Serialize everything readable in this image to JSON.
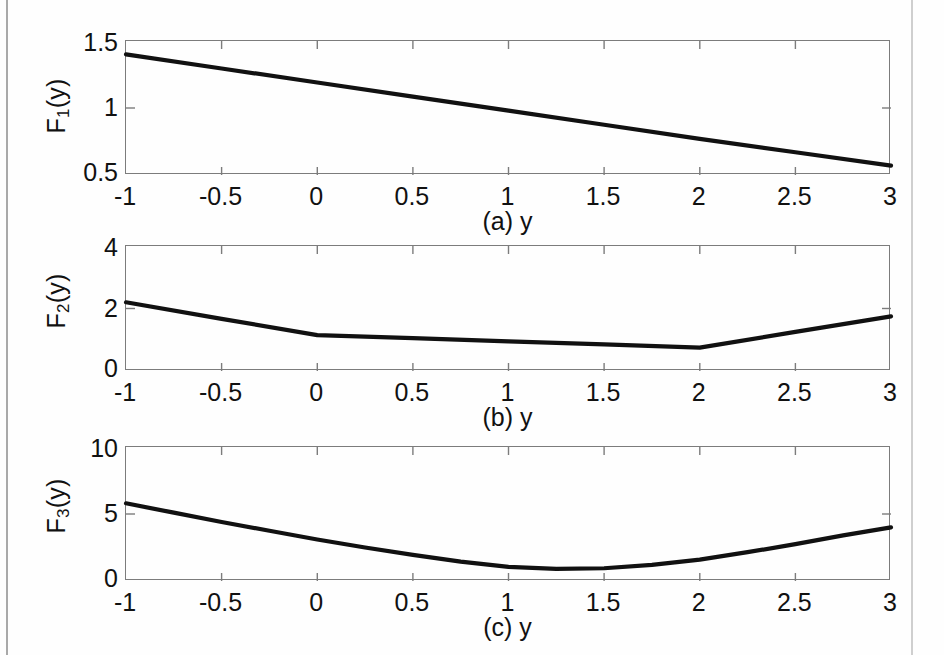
{
  "figure": {
    "background_color": "#fefefe",
    "line_color": "#111111",
    "axis_color": "#7c7c7c"
  },
  "panels": [
    {
      "key": "a",
      "caption": "(a) y",
      "ylabel_main": "F",
      "ylabel_sub": "1",
      "ylabel_tail": "(y)",
      "yticks": [
        "0.5",
        "1",
        "1.5"
      ],
      "xticks": [
        "-1",
        "-0.5",
        "0",
        "0.5",
        "1",
        "1.5",
        "2",
        "2.5",
        "3"
      ]
    },
    {
      "key": "b",
      "caption": "(b) y",
      "ylabel_main": "F",
      "ylabel_sub": "2",
      "ylabel_tail": "(y)",
      "yticks": [
        "0",
        "2",
        "4"
      ],
      "xticks": [
        "-1",
        "-0.5",
        "0",
        "0.5",
        "1",
        "1.5",
        "2",
        "2.5",
        "3"
      ]
    },
    {
      "key": "c",
      "caption": "(c) y",
      "ylabel_main": "F",
      "ylabel_sub": "3",
      "ylabel_tail": "(y)",
      "yticks": [
        "0",
        "5",
        "10"
      ],
      "xticks": [
        "-1",
        "-0.5",
        "0",
        "0.5",
        "1",
        "1.5",
        "2",
        "2.5",
        "3"
      ]
    }
  ],
  "chart_data": [
    {
      "type": "line",
      "panel": "a",
      "title": "",
      "xlabel": "(a) y",
      "ylabel": "F_1(y)",
      "xlim": [
        -1,
        3
      ],
      "ylim": [
        0.5,
        1.5
      ],
      "xticks": [
        -1,
        -0.5,
        0,
        0.5,
        1,
        1.5,
        2,
        2.5,
        3
      ],
      "yticks": [
        0.5,
        1,
        1.5
      ],
      "grid": false,
      "legend": "none",
      "x": [
        -1,
        -0.5,
        0,
        0.5,
        1,
        1.5,
        2,
        2.5,
        3
      ],
      "y": [
        1.4,
        1.295,
        1.19,
        1.085,
        0.98,
        0.875,
        0.77,
        0.67,
        0.57
      ]
    },
    {
      "type": "line",
      "panel": "b",
      "title": "",
      "xlabel": "(b) y",
      "ylabel": "F_2(y)",
      "xlim": [
        -1,
        3
      ],
      "ylim": [
        0,
        4
      ],
      "xticks": [
        -1,
        -0.5,
        0,
        0.5,
        1,
        1.5,
        2,
        2.5,
        3
      ],
      "yticks": [
        0,
        2,
        4
      ],
      "grid": false,
      "legend": "none",
      "note": "piecewise linear with breakpoints at y=0 and y=2",
      "x": [
        -1,
        -0.5,
        0,
        0.5,
        1,
        1.5,
        2,
        2.5,
        3
      ],
      "y": [
        2.2,
        1.67,
        1.15,
        1.05,
        0.95,
        0.85,
        0.75,
        1.25,
        1.75
      ]
    },
    {
      "type": "line",
      "panel": "c",
      "title": "",
      "xlabel": "(c) y",
      "ylabel": "F_3(y)",
      "xlim": [
        -1,
        3
      ],
      "ylim": [
        0,
        10
      ],
      "xticks": [
        -1,
        -0.5,
        0,
        0.5,
        1,
        1.5,
        2,
        2.5,
        3
      ],
      "yticks": [
        0,
        5,
        10
      ],
      "grid": false,
      "legend": "none",
      "note": "convex parabola, minimum near y=1.15 with value about 0.9",
      "x": [
        -1,
        -0.75,
        -0.5,
        -0.25,
        0,
        0.25,
        0.5,
        0.75,
        1,
        1.25,
        1.5,
        1.75,
        2,
        2.25,
        2.5,
        2.75,
        3
      ],
      "y": [
        5.8,
        5.1,
        4.4,
        3.75,
        3.1,
        2.5,
        1.95,
        1.45,
        1.05,
        0.9,
        0.95,
        1.2,
        1.6,
        2.15,
        2.75,
        3.4,
        4.0
      ]
    }
  ]
}
